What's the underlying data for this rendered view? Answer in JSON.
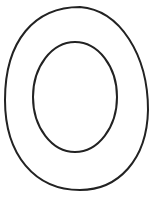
{
  "figure": {
    "stroke_color": "#222222",
    "background": "#ffffff",
    "outer_shape": {
      "cx": 76,
      "cy": 98,
      "rx": 72,
      "ry": 92
    },
    "inner_shape": {
      "cx": 75,
      "cy": 97,
      "rx": 42,
      "ry": 56
    }
  },
  "caption": {
    "text": ""
  }
}
